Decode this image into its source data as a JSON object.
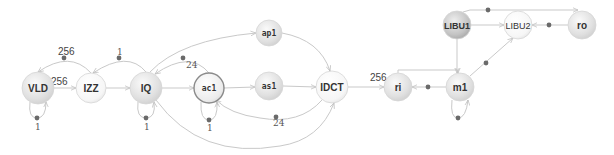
{
  "diagram": {
    "type": "dataflow-graph",
    "colors": {
      "node_light": "#f7f7f7",
      "node_mid": "#e2e2e2",
      "node_dark": "#c8c8c8",
      "edge": "#c9c9c9",
      "token": "#6a6a6a"
    },
    "nodes": [
      {
        "id": "VLD",
        "label": "VLD",
        "x": 38,
        "y": 88,
        "r": 16,
        "shade": "mid"
      },
      {
        "id": "IZZ",
        "label": "IZZ",
        "x": 91,
        "y": 88,
        "r": 15,
        "shade": "light"
      },
      {
        "id": "IQ",
        "label": "IQ",
        "x": 146,
        "y": 88,
        "r": 16,
        "shade": "mid"
      },
      {
        "id": "ac1",
        "label": "ac1",
        "x": 209,
        "y": 88,
        "r": 15,
        "shade": "outlined"
      },
      {
        "id": "ap1",
        "label": "ap1",
        "x": 269,
        "y": 33,
        "r": 13,
        "shade": "mid"
      },
      {
        "id": "as1",
        "label": "as1",
        "x": 269,
        "y": 86,
        "r": 14,
        "shade": "mid"
      },
      {
        "id": "IDCT",
        "label": "IDCT",
        "x": 332,
        "y": 87,
        "r": 16,
        "shade": "light"
      },
      {
        "id": "ri",
        "label": "ri",
        "x": 398,
        "y": 87,
        "r": 14,
        "shade": "mid"
      },
      {
        "id": "m1",
        "label": "m1",
        "x": 460,
        "y": 87,
        "r": 14,
        "shade": "mid"
      },
      {
        "id": "LIBU1",
        "label": "LIBU1",
        "x": 457,
        "y": 25,
        "r": 14,
        "shade": "dark"
      },
      {
        "id": "LIBU2",
        "label": "LIBU2",
        "x": 518,
        "y": 25,
        "r": 14,
        "shade": "light"
      },
      {
        "id": "ro",
        "label": "ro",
        "x": 582,
        "y": 25,
        "r": 14,
        "shade": "mid"
      }
    ],
    "edges": [
      {
        "from": "VLD",
        "to": "IZZ",
        "label": "256",
        "path": "M54 88 L76 88"
      },
      {
        "from": "IZZ",
        "to": "VLD",
        "label": "256",
        "path": "M91 73 Q70 50 38 72",
        "dot": [
          64,
          58
        ]
      },
      {
        "from": "VLD",
        "to": "VLD",
        "label": "1",
        "path": "M30 102 Q28 118 37 118 Q46 118 46 102",
        "dot": [
          37,
          118
        ]
      },
      {
        "from": "IZZ",
        "to": "IQ",
        "label": "",
        "path": "M106 88 L130 88"
      },
      {
        "from": "IQ",
        "to": "IZZ",
        "label": "1",
        "path": "M146 72 Q128 50 93 73",
        "dot": [
          119,
          58
        ]
      },
      {
        "from": "IQ",
        "to": "IQ",
        "label": "1",
        "path": "M138 102 Q136 118 146 118 Q156 118 154 102",
        "dot": [
          146,
          118
        ]
      },
      {
        "from": "IQ",
        "to": "ac1",
        "label": "",
        "path": "M162 88 L194 88"
      },
      {
        "from": "ac1",
        "to": "IQ",
        "label": "24",
        "path": "M209 73 Q190 50 155 74",
        "dot": [
          183,
          58
        ]
      },
      {
        "from": "ac1",
        "to": "ac1",
        "label": "1",
        "path": "M201 102 Q200 120 209 120 Q218 120 217 102",
        "dot": [
          209,
          120
        ]
      },
      {
        "from": "IQ",
        "to": "ap1",
        "label": "",
        "path": "M150 72 Q180 40 256 33"
      },
      {
        "from": "ac1",
        "to": "as1",
        "label": "",
        "path": "M224 88 L255 87"
      },
      {
        "from": "ap1",
        "to": "IDCT",
        "label": "",
        "path": "M282 33 Q320 40 330 71"
      },
      {
        "from": "as1",
        "to": "IDCT",
        "label": "",
        "path": "M283 86 L316 87"
      },
      {
        "from": "IDCT",
        "to": "ac1",
        "label": "24",
        "path": "M322 100 Q300 125 260 118 Q230 114 216 100",
        "dot": [
          276,
          117
        ]
      },
      {
        "from": "IQ",
        "to": "IDCT",
        "label": "",
        "path": "M156 100 Q200 160 280 146 Q320 140 334 103"
      },
      {
        "from": "IDCT",
        "to": "ri",
        "label": "256",
        "path": "M348 87 L384 87"
      },
      {
        "from": "m1",
        "to": "ri",
        "label": "",
        "path": "M446 87 L412 87",
        "dot": [
          428,
          87
        ]
      },
      {
        "from": "ri",
        "to": "m1",
        "label": "",
        "path": "M398 73 L398 70 L458 70 L458 73"
      },
      {
        "from": "m1",
        "to": "m1",
        "label": "",
        "path": "M452 100 Q450 118 458 118 Q466 118 468 100",
        "dot": [
          458,
          118
        ]
      },
      {
        "from": "LIBU1",
        "to": "m1",
        "label": "",
        "path": "M457 39 L457 73"
      },
      {
        "from": "m1",
        "to": "LIBU2",
        "label": "",
        "path": "M470 76 L513 38",
        "dot": [
          486,
          63
        ]
      },
      {
        "from": "LIBU1",
        "to": "LIBU2",
        "label": "",
        "path": "M471 25 L504 25"
      },
      {
        "from": "ro",
        "to": "LIBU2",
        "label": "",
        "path": "M568 25 L532 25",
        "dot": [
          549,
          25
        ]
      },
      {
        "from": "LIBU1",
        "to": "ro",
        "label": "",
        "path": "M463 12 L470 10 L578 10",
        "dot": [
          488,
          10
        ]
      }
    ],
    "edge_labels": [
      {
        "text": "256",
        "x": 58,
        "y": 55,
        "size": "lg"
      },
      {
        "text": "256",
        "x": 51,
        "y": 85,
        "size": "lg"
      },
      {
        "text": "1",
        "x": 35,
        "y": 130,
        "size": "sm"
      },
      {
        "text": "1",
        "x": 117,
        "y": 55,
        "size": "sm"
      },
      {
        "text": "1",
        "x": 144,
        "y": 130,
        "size": "sm"
      },
      {
        "text": "24",
        "x": 186,
        "y": 68,
        "size": "sm"
      },
      {
        "text": "1",
        "x": 207,
        "y": 131,
        "size": "sm"
      },
      {
        "text": "24",
        "x": 273,
        "y": 126,
        "size": "sm"
      },
      {
        "text": "256",
        "x": 370,
        "y": 81,
        "size": "lg"
      }
    ]
  }
}
